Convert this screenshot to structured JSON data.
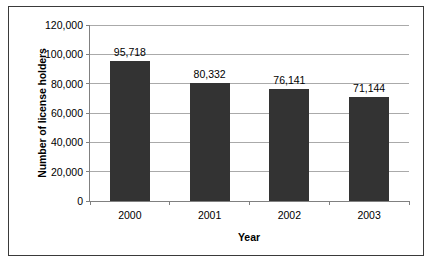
{
  "chart_data": {
    "type": "bar",
    "title": "",
    "categories": [
      "2000",
      "2001",
      "2002",
      "2003"
    ],
    "values": [
      95718,
      80332,
      76141,
      71144
    ],
    "value_labels": [
      "95,718",
      "80,332",
      "76,141",
      "71,144"
    ],
    "xlabel": "Year",
    "ylabel": "Number of license holders",
    "ylim": [
      0,
      120000
    ],
    "ytick_values": [
      0,
      20000,
      40000,
      60000,
      80000,
      100000,
      120000
    ],
    "ytick_labels": [
      "0",
      "20,000",
      "40,000",
      "60,000",
      "80,000",
      "100,000",
      "120,000"
    ],
    "grid": true,
    "legend": false,
    "bar_color": "#333333",
    "gridline_color": "#aaaaaa",
    "axis_color": "#808080",
    "plot_background": "#ffffff",
    "frame_border_color": "#3a3a3a"
  }
}
